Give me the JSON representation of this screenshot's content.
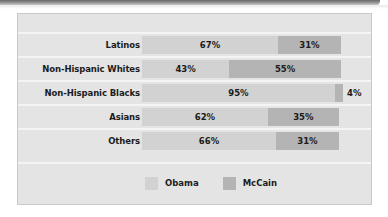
{
  "decor": {
    "top_strip_name": "top-accent-strip"
  },
  "chart_data": {
    "type": "bar",
    "orientation": "horizontal",
    "stacked": true,
    "title": "",
    "subtitle": "",
    "xlabel": "",
    "ylabel": "",
    "xlim": [
      0,
      100
    ],
    "grid": false,
    "legend_position": "bottom",
    "categories": [
      "Latinos",
      "Non-Hispanic Whites",
      "Non-Hispanic Blacks",
      "Asians",
      "Others"
    ],
    "series": [
      {
        "name": "Obama",
        "color": "#d2d2d2",
        "values": [
          67,
          43,
          95,
          62,
          66
        ],
        "labels": [
          "67%",
          "43%",
          "95%",
          "62%",
          "66%"
        ]
      },
      {
        "name": "McCain",
        "color": "#b4b4b4",
        "values": [
          31,
          55,
          4,
          35,
          31
        ],
        "labels": [
          "31%",
          "55%",
          "4%",
          "35%",
          "31%"
        ]
      }
    ],
    "rows": [
      {
        "label": "Latinos",
        "obama_value": 67,
        "obama_label": "67%",
        "mccain_value": 31,
        "mccain_label": "31%",
        "mccain_label_outside": false
      },
      {
        "label": "Non-Hispanic Whites",
        "obama_value": 43,
        "obama_label": "43%",
        "mccain_value": 55,
        "mccain_label": "55%",
        "mccain_label_outside": false
      },
      {
        "label": "Non-Hispanic Blacks",
        "obama_value": 95,
        "obama_label": "95%",
        "mccain_value": 4,
        "mccain_label": "4%",
        "mccain_label_outside": true
      },
      {
        "label": "Asians",
        "obama_value": 62,
        "obama_label": "62%",
        "mccain_value": 35,
        "mccain_label": "35%",
        "mccain_label_outside": false
      },
      {
        "label": "Others",
        "obama_value": 66,
        "obama_label": "66%",
        "mccain_value": 31,
        "mccain_label": "31%",
        "mccain_label_outside": false
      }
    ],
    "legend": [
      {
        "label": "Obama",
        "color": "#d2d2d2"
      },
      {
        "label": "McCain",
        "color": "#b4b4b4"
      }
    ]
  },
  "colors": {
    "panel_background": "#e4e4e4",
    "panel_border": "#c9c9c9",
    "separator": "#f4f4f4",
    "obama": "#d2d2d2",
    "mccain": "#b4b4b4",
    "text": "#1c1c1c",
    "page_background": "#ffffff"
  }
}
